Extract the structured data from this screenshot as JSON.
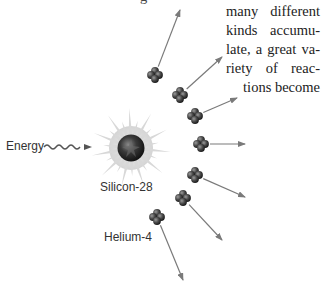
{
  "figure": {
    "energy_label": "Energy",
    "nucleus_label": "Silicon-28",
    "particle_label": "Helium-4",
    "colors": {
      "arrow": "#7a7a7a",
      "starburst": "#d8d8d8",
      "nucleus_dark": "#2a2a2a",
      "particle": "#4a4a4a",
      "text": "#333333"
    },
    "particles": [
      {
        "x": 155,
        "y": 75,
        "ax": 180,
        "ay": 10
      },
      {
        "x": 180,
        "y": 95,
        "ax": 222,
        "ay": 57
      },
      {
        "x": 195,
        "y": 116,
        "ax": 237,
        "ay": 98
      },
      {
        "x": 201,
        "y": 144,
        "ax": 245,
        "ay": 144
      },
      {
        "x": 195,
        "y": 175,
        "ax": 245,
        "ay": 197
      },
      {
        "x": 183,
        "y": 198,
        "ax": 222,
        "ay": 240
      },
      {
        "x": 157,
        "y": 217,
        "ax": 183,
        "ay": 280
      }
    ]
  },
  "text_block": {
    "top_fragment": "g",
    "lines": [
      "many different",
      "kinds accumu-",
      "late, a great va-",
      "riety of reac-",
      "tions become"
    ]
  }
}
